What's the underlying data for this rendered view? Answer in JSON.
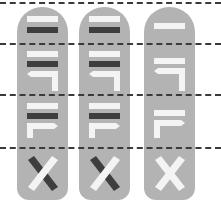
{
  "diagram": {
    "colors": {
      "background": "#ffffff",
      "pill": "#b3b3b3",
      "light_bar": "#f4f4f4",
      "dark_bar": "#3e3e3e",
      "dashed_line": "#3a3a3a"
    },
    "dashed_lines_y": [
      3,
      44,
      95,
      148
    ],
    "columns": [
      {
        "id": "col-1",
        "segments": [
          "white-bar+dark-bar",
          "white-bar+dark-bar+L-arrow-left",
          "white-bar+dark-bar+L-arrow-right",
          "X-dark-white"
        ]
      },
      {
        "id": "col-2",
        "segments": [
          "white-bar+dark-bar",
          "white-bar+dark-bar+L-arrow-left",
          "white-bar+dark-bar+L-arrow-right",
          "X-dark-white"
        ]
      },
      {
        "id": "col-3",
        "segments": [
          "white-bar",
          "white-bar+L-arrow-left",
          "white-bar+L-arrow-right",
          "X-white-white"
        ]
      }
    ]
  }
}
